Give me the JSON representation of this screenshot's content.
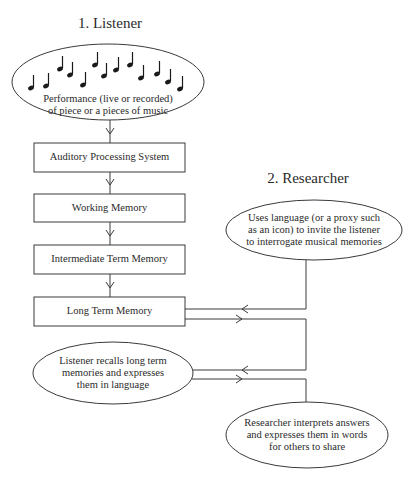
{
  "sections": {
    "listener_title": "1. Listener",
    "researcher_title": "2. Researcher"
  },
  "listener_flow": {
    "performance": {
      "line1": "Performance (live or recorded)",
      "line2": "of piece or a pieces of music",
      "icon": "music-notes-icon"
    },
    "boxes": [
      {
        "label": "Auditory Processing System"
      },
      {
        "label": "Working Memory"
      },
      {
        "label": "Intermediate Term Memory"
      },
      {
        "label": "Long Term Memory"
      }
    ],
    "recall": {
      "line1": "Listener recalls long term",
      "line2": "memories and expresses",
      "line3": "them in language"
    }
  },
  "researcher_flow": {
    "invite": {
      "line1": "Uses language (or a proxy such",
      "line2": "as an icon) to invite the listener",
      "line3": "to interrogate musical memories"
    },
    "interpret": {
      "line1": "Researcher interprets answers",
      "line2": "and expresses them in words",
      "line3": "for others to share"
    }
  },
  "colors": {
    "stroke": "#3a3a3a",
    "text": "#2a2a2a",
    "background": "#ffffff"
  }
}
